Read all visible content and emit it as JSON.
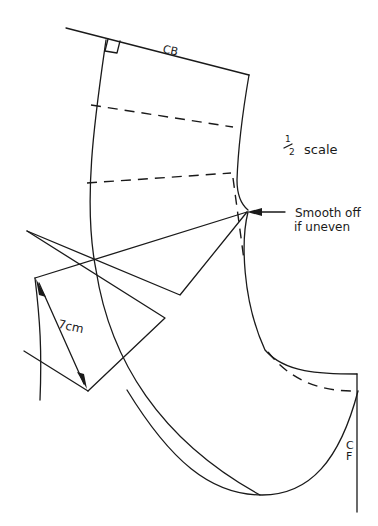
{
  "diagram": {
    "type": "sewing-pattern-draft",
    "labels": {
      "center_back": "CB",
      "scale_fraction_num": "1",
      "scale_fraction_den": "2",
      "scale_text": "scale",
      "note_line1": "Smooth off",
      "note_line2": "if uneven",
      "measurement": "7cm",
      "center_front_c": "C",
      "center_front_f": "F"
    },
    "colors": {
      "ink": "#1a1a1a",
      "paper": "#ffffff"
    }
  }
}
